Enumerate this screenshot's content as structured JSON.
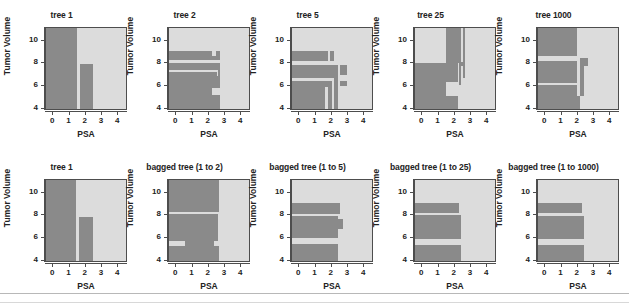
{
  "figure": {
    "axis_label_x": "PSA",
    "axis_label_y": "Tumor Volume",
    "xticks": [
      "0",
      "1",
      "2",
      "3",
      "4"
    ],
    "yticks": [
      "4",
      "6",
      "8",
      "10"
    ],
    "xlim": [
      -0.45,
      4.6
    ],
    "ylim": [
      3.8,
      11.1
    ],
    "colors": {
      "class_a": "#8a8a8a",
      "class_b": "#dcdcdc",
      "axis": "#4d4d4d",
      "text": "#222222",
      "rule": "#b8b8b8"
    }
  },
  "panels": [
    {
      "title": "tree 1",
      "row": 0,
      "col": 0
    },
    {
      "title": "tree 2",
      "row": 0,
      "col": 1
    },
    {
      "title": "tree 5",
      "row": 0,
      "col": 2
    },
    {
      "title": "tree 25",
      "row": 0,
      "col": 3
    },
    {
      "title": "tree 1000",
      "row": 0,
      "col": 4
    },
    {
      "title": "tree 1",
      "row": 1,
      "col": 0
    },
    {
      "title": "bagged tree (1 to 2)",
      "row": 1,
      "col": 1
    },
    {
      "title": "bagged tree (1 to 5)",
      "row": 1,
      "col": 2
    },
    {
      "title": "bagged tree (1 to 25)",
      "row": 1,
      "col": 3
    },
    {
      "title": "bagged tree (1 to 1000)",
      "row": 1,
      "col": 4
    }
  ],
  "chart_data": {
    "type": "heatmap",
    "xlabel": "PSA",
    "ylabel": "Tumor Volume",
    "xlim": [
      -0.45,
      4.6
    ],
    "ylim": [
      3.8,
      11.1
    ],
    "xtick_values": [
      0,
      1,
      2,
      3,
      4
    ],
    "ytick_values": [
      4,
      6,
      8,
      10
    ],
    "grid": false,
    "legend": "none",
    "classes": [
      {
        "name": "class-dark",
        "color": "#8a8a8a"
      },
      {
        "name": "class-light",
        "color": "#dcdcdc"
      }
    ],
    "panels": [
      {
        "title": "tree 1",
        "regions_dark": [
          {
            "x0": -0.45,
            "x1": 1.52,
            "y0": 3.8,
            "y1": 11.1
          },
          {
            "x0": 1.67,
            "x1": 2.52,
            "y0": 3.8,
            "y1": 7.85
          }
        ]
      },
      {
        "title": "tree 2",
        "regions_dark": [
          {
            "x0": -0.45,
            "x1": 2.8,
            "y0": 3.8,
            "y1": 5.05
          },
          {
            "x0": -0.45,
            "x1": 2.28,
            "y0": 5.05,
            "y1": 5.65
          },
          {
            "x0": -0.45,
            "x1": 2.8,
            "y0": 5.65,
            "y1": 6.8
          },
          {
            "x0": -0.45,
            "x1": 2.55,
            "y0": 6.8,
            "y1": 7.1
          },
          {
            "x0": 2.62,
            "x1": 2.8,
            "y0": 6.8,
            "y1": 7.35
          },
          {
            "x0": -0.45,
            "x1": 2.8,
            "y0": 7.35,
            "y1": 7.95
          },
          {
            "x0": -0.45,
            "x1": 2.8,
            "y0": 8.2,
            "y1": 8.6
          },
          {
            "x0": -0.45,
            "x1": 2.28,
            "y0": 8.6,
            "y1": 9.0
          },
          {
            "x0": 2.52,
            "x1": 2.8,
            "y0": 8.6,
            "y1": 9.0
          }
        ]
      },
      {
        "title": "tree 5",
        "regions_dark": [
          {
            "x0": -0.45,
            "x1": 1.62,
            "y0": 3.8,
            "y1": 5.8
          },
          {
            "x0": -0.45,
            "x1": 2.08,
            "y0": 5.8,
            "y1": 6.3
          },
          {
            "x0": 1.8,
            "x1": 2.08,
            "y0": 3.8,
            "y1": 5.8
          },
          {
            "x0": 2.2,
            "x1": 2.45,
            "y0": 3.8,
            "y1": 7.8
          },
          {
            "x0": -0.45,
            "x1": 2.45,
            "y0": 6.55,
            "y1": 7.8
          },
          {
            "x0": 2.55,
            "x1": 3.05,
            "y0": 6.9,
            "y1": 7.8
          },
          {
            "x0": 2.55,
            "x1": 3.05,
            "y0": 5.85,
            "y1": 6.35
          },
          {
            "x0": -0.45,
            "x1": 1.8,
            "y0": 8.1,
            "y1": 9.0
          },
          {
            "x0": 1.95,
            "x1": 2.2,
            "y0": 8.1,
            "y1": 9.0
          }
        ]
      },
      {
        "title": "tree 25",
        "regions_dark": [
          {
            "x0": -0.45,
            "x1": 2.25,
            "y0": 3.8,
            "y1": 5.0
          },
          {
            "x0": -0.45,
            "x1": 1.52,
            "y0": 5.0,
            "y1": 7.95
          },
          {
            "x0": 1.52,
            "x1": 2.25,
            "y0": 6.25,
            "y1": 7.95
          },
          {
            "x0": 2.3,
            "x1": 2.48,
            "y0": 5.95,
            "y1": 11.1
          },
          {
            "x0": 2.55,
            "x1": 2.7,
            "y0": 6.6,
            "y1": 11.1
          },
          {
            "x0": 1.52,
            "x1": 2.3,
            "y0": 7.95,
            "y1": 11.1
          },
          {
            "x0": 2.3,
            "x1": 2.6,
            "y0": 7.7,
            "y1": 8.05
          }
        ]
      },
      {
        "title": "tree 1000",
        "regions_dark": [
          {
            "x0": -0.45,
            "x1": 2.2,
            "y0": 3.8,
            "y1": 4.95
          },
          {
            "x0": -0.45,
            "x1": 2.0,
            "y0": 4.95,
            "y1": 5.95
          },
          {
            "x0": 2.2,
            "x1": 2.45,
            "y0": 4.95,
            "y1": 6.15
          },
          {
            "x0": -0.45,
            "x1": 2.0,
            "y0": 6.15,
            "y1": 8.15
          },
          {
            "x0": 2.2,
            "x1": 2.45,
            "y0": 6.15,
            "y1": 8.4
          },
          {
            "x0": -0.45,
            "x1": 2.0,
            "y0": 8.55,
            "y1": 11.1
          },
          {
            "x0": 2.45,
            "x1": 2.7,
            "y0": 7.7,
            "y1": 8.4
          }
        ]
      },
      {
        "title": "tree 1",
        "regions_dark": [
          {
            "x0": -0.45,
            "x1": 1.45,
            "y0": 3.8,
            "y1": 11.1
          },
          {
            "x0": 1.62,
            "x1": 2.52,
            "y0": 3.8,
            "y1": 7.8
          }
        ]
      },
      {
        "title": "bagged tree (1 to 2)",
        "regions_dark": [
          {
            "x0": -0.45,
            "x1": 2.7,
            "y0": 3.8,
            "y1": 5.15
          },
          {
            "x0": -0.45,
            "x1": 2.62,
            "y0": 5.6,
            "y1": 8.0
          },
          {
            "x0": -0.45,
            "x1": 2.7,
            "y0": 8.2,
            "y1": 11.1
          },
          {
            "x0": 0.55,
            "x1": 2.4,
            "y0": 5.15,
            "y1": 5.6
          }
        ]
      },
      {
        "title": "bagged tree (1 to 5)",
        "regions_dark": [
          {
            "x0": -0.45,
            "x1": 2.45,
            "y0": 3.8,
            "y1": 5.35
          },
          {
            "x0": -0.45,
            "x1": 2.45,
            "y0": 5.85,
            "y1": 7.85
          },
          {
            "x0": -0.45,
            "x1": 2.6,
            "y0": 8.05,
            "y1": 9.05
          },
          {
            "x0": 2.45,
            "x1": 2.8,
            "y0": 6.7,
            "y1": 7.6
          }
        ]
      },
      {
        "title": "bagged tree (1 to 25)",
        "regions_dark": [
          {
            "x0": -0.45,
            "x1": 2.45,
            "y0": 3.8,
            "y1": 5.25
          },
          {
            "x0": -0.45,
            "x1": 2.45,
            "y0": 5.75,
            "y1": 7.95
          },
          {
            "x0": -0.45,
            "x1": 2.3,
            "y0": 8.15,
            "y1": 9.05
          }
        ]
      },
      {
        "title": "bagged tree (1 to 1000)",
        "regions_dark": [
          {
            "x0": -0.45,
            "x1": 2.45,
            "y0": 3.8,
            "y1": 5.25
          },
          {
            "x0": -0.45,
            "x1": 2.45,
            "y0": 5.75,
            "y1": 7.9
          },
          {
            "x0": -0.45,
            "x1": 2.3,
            "y0": 8.1,
            "y1": 9.05
          }
        ]
      }
    ]
  }
}
